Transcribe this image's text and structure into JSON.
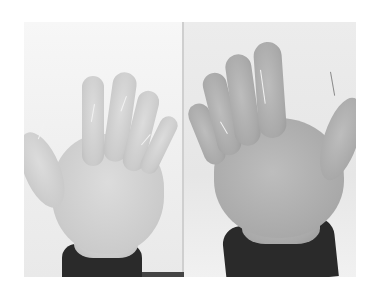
{
  "image": {
    "description": "Grayscale photograph of two open palms facing the camera with fine acupuncture needles inserted in fingers and near the thumbs, against a light background split into two panels",
    "hands": [
      {
        "side": "left",
        "tone": "light",
        "needles": 4
      },
      {
        "side": "right",
        "tone": "darker",
        "needles": 3
      }
    ],
    "colors": {
      "background": "#ffffff",
      "panel_left": "#eeeeee",
      "panel_right": "#e6e6e6",
      "skin_left": "#cbcbcb",
      "skin_right": "#a9a9a9",
      "sleeve": "#2a2a2a"
    }
  }
}
